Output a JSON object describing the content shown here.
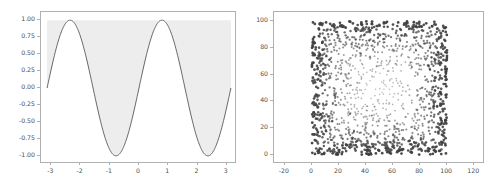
{
  "figure": {
    "width": 497,
    "height": 189,
    "background": "#ffffff",
    "panel_count": 2
  },
  "style": {
    "spine_color": "#b0b0b0",
    "tick_color": "#b0b0b0",
    "ticklabel_color": "#4d4d4d",
    "line_color": "#555555",
    "fill_color": "#ededed",
    "scatter_color": "#3f3f3f"
  },
  "chart_data": [
    {
      "id": "left-panel",
      "type": "area",
      "title": "",
      "xlabel": "",
      "ylabel": "",
      "xlim": [
        -3.35,
        3.35
      ],
      "ylim": [
        -1.12,
        1.12
      ],
      "grid": false,
      "legend": null,
      "xticks": [
        -3,
        -2,
        -1,
        0,
        1,
        2,
        3
      ],
      "xticklabels": [
        "-3",
        "-2",
        "-1",
        "0",
        "1",
        "2",
        "3"
      ],
      "yticks": [
        1.0,
        0.75,
        0.5,
        0.25,
        0.0,
        -0.25,
        -0.5,
        -0.75,
        -1.0
      ],
      "yticklabels": [
        "1.00",
        "0.75",
        "0.50",
        "0.25",
        "0.00",
        "-0.25",
        "-0.50",
        "-0.75",
        "-1.00"
      ],
      "series": [
        {
          "name": "sine",
          "kind": "line",
          "expression": "sin(2x)",
          "x_range": [
            -3.14159,
            3.14159
          ],
          "fill_to": 1.0,
          "fill_label": "region between curve and y = 1.00",
          "x": [
            -3.14159,
            -3.01593,
            -2.89027,
            -2.7646,
            -2.63894,
            -2.51328,
            -2.38762,
            -2.26195,
            -2.13629,
            -2.01063,
            -1.88496,
            -1.7593,
            -1.63364,
            -1.50798,
            -1.38231,
            -1.25665,
            -1.13099,
            -1.00533,
            -0.87966,
            -0.754,
            -0.62832,
            -0.50265,
            -0.37699,
            -0.25133,
            -0.12566,
            0.0,
            0.12566,
            0.25133,
            0.37699,
            0.50265,
            0.62832,
            0.754,
            0.87966,
            1.00533,
            1.13099,
            1.25665,
            1.38231,
            1.50798,
            1.63364,
            1.7593,
            1.88496,
            2.01063,
            2.13629,
            2.26195,
            2.38762,
            2.51328,
            2.63894,
            2.7646,
            2.89027,
            3.01593,
            3.14159
          ],
          "y": [
            0.0,
            0.2487,
            0.4818,
            0.6845,
            0.8443,
            0.9511,
            0.998,
            0.9823,
            0.9048,
            0.7705,
            0.5878,
            0.3681,
            0.1253,
            -0.1253,
            -0.3681,
            -0.5878,
            -0.7705,
            -0.9048,
            -0.9823,
            -0.998,
            -0.9511,
            -0.8443,
            -0.6845,
            -0.4818,
            -0.2487,
            0.0,
            0.2487,
            0.4818,
            0.6845,
            0.8443,
            0.9511,
            0.998,
            0.9823,
            0.9048,
            0.7705,
            0.5878,
            0.3681,
            0.1253,
            -0.1253,
            -0.3681,
            -0.5878,
            -0.7705,
            -0.9048,
            -0.9823,
            -0.998,
            -0.9511,
            -0.8443,
            -0.6845,
            -0.4818,
            -0.2487,
            0.0
          ]
        }
      ]
    },
    {
      "id": "right-panel",
      "type": "scatter",
      "title": "",
      "xlabel": "",
      "ylabel": "",
      "xlim": [
        -28,
        128
      ],
      "ylim": [
        -7,
        107
      ],
      "grid": false,
      "legend": null,
      "xticks": [
        -20,
        0,
        20,
        40,
        60,
        80,
        100,
        120
      ],
      "xticklabels": [
        "-20",
        "0",
        "20",
        "40",
        "60",
        "80",
        "100",
        "120"
      ],
      "yticks": [
        0,
        20,
        40,
        60,
        80,
        100
      ],
      "yticklabels": [
        "0",
        "20",
        "40",
        "60",
        "80",
        "100"
      ],
      "series": [
        {
          "name": "random-points",
          "kind": "scatter",
          "point_count": 2000,
          "marker": "dot",
          "marker_size": 1.3,
          "x_domain": [
            0,
            100
          ],
          "y_domain": [
            0,
            100
          ],
          "distribution": "uniform-random with increased density and opacity near domain edges"
        }
      ]
    }
  ]
}
